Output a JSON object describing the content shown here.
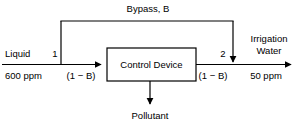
{
  "diagram": {
    "line_color": "#000000",
    "box": {
      "label": "Control Device"
    },
    "bypass": {
      "label_text": "Bypass, ",
      "label_symbol": "B"
    },
    "inlet": {
      "name": "Liquid",
      "node": "1",
      "concentration": "600 ppm",
      "fraction_prefix": "(1 − ",
      "fraction_symbol": "B",
      "fraction_suffix": ")"
    },
    "outlet": {
      "node": "2",
      "name_line1": "Irrigation",
      "name_line2": "Water",
      "concentration": "50 ppm",
      "fraction_prefix": "(1 − ",
      "fraction_symbol": "B",
      "fraction_suffix": ")"
    },
    "waste": {
      "label": "Pollutant"
    }
  }
}
